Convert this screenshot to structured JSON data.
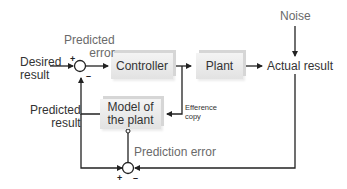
{
  "diagram": {
    "blocks": {
      "controller": "Controller",
      "plant": "Plant",
      "model_line1": "Model of",
      "model_line2": "the plant"
    },
    "labels": {
      "desired_line1": "Desired",
      "desired_line2": "result",
      "predicted_error_line1": "Predicted",
      "predicted_error_line2": "error",
      "noise": "Noise",
      "actual_result": "Actual result",
      "predicted_result_line1": "Predicted",
      "predicted_result_line2": "result",
      "efference_line1": "Efference",
      "efference_line2": "copy",
      "prediction_error": "Prediction error"
    },
    "signs": {
      "top_plus": "+",
      "top_minus": "–",
      "bottom_plus": "+",
      "bottom_minus": "–"
    },
    "colors": {
      "line": "#222222",
      "box_fill": "#e8e8e8",
      "text_gray": "#6a6a6a"
    }
  }
}
